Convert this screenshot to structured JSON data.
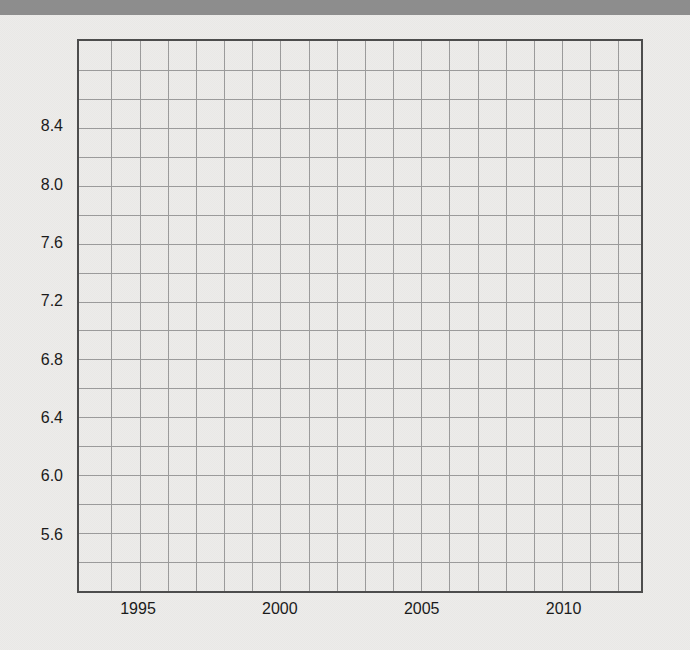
{
  "window": {
    "top_bar_color": "#8d8d8d",
    "background_color": "#ebeae8"
  },
  "chart_data": {
    "type": "line",
    "title": "",
    "xlabel": "",
    "ylabel": "",
    "series": [],
    "xlim": [
      1992.85,
      2012.8
    ],
    "ylim": [
      5.2,
      9.0
    ],
    "grid": true,
    "legend": false,
    "x_gridlines": [
      1994,
      1995,
      1996,
      1997,
      1998,
      1999,
      2000,
      2001,
      2002,
      2003,
      2004,
      2005,
      2006,
      2007,
      2008,
      2009,
      2010,
      2011,
      2012
    ],
    "y_gridlines": [
      8.8,
      8.6,
      8.4,
      8.2,
      8.0,
      7.8,
      7.6,
      7.4,
      7.2,
      7.0,
      6.8,
      6.6,
      6.4,
      6.2,
      6.0,
      5.8,
      5.6,
      5.4
    ],
    "x_ticks": [
      {
        "value": 1995,
        "label": "1995"
      },
      {
        "value": 2000,
        "label": "2000"
      },
      {
        "value": 2005,
        "label": "2005"
      },
      {
        "value": 2010,
        "label": "2010"
      }
    ],
    "y_ticks": [
      {
        "value": 8.4,
        "label": "8.4"
      },
      {
        "value": 8.0,
        "label": "8.0"
      },
      {
        "value": 7.6,
        "label": "7.6"
      },
      {
        "value": 7.2,
        "label": "7.2"
      },
      {
        "value": 6.8,
        "label": "6.8"
      },
      {
        "value": 6.4,
        "label": "6.4"
      },
      {
        "value": 6.0,
        "label": "6.0"
      },
      {
        "value": 5.6,
        "label": "5.6"
      }
    ],
    "colors": {
      "gridline": "#9b9b9b",
      "frame": "#4d4d4d",
      "tick_label": "#1b1b1b",
      "plot_background": "transparent"
    }
  }
}
